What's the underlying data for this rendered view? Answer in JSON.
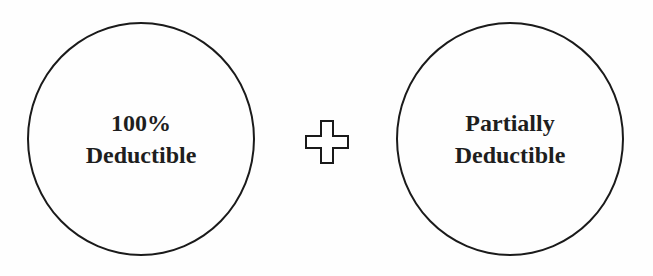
{
  "diagram": {
    "left_circle": {
      "line1": "100%",
      "line2": "Deductible"
    },
    "operator": "plus-icon",
    "right_circle": {
      "line1": "Partially",
      "line2": "Deductible"
    }
  }
}
